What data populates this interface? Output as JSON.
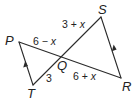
{
  "diagram": {
    "vertices": {
      "P": {
        "label": "P",
        "x": 19,
        "y": 42
      },
      "S": {
        "label": "S",
        "x": 101,
        "y": 17
      },
      "R": {
        "label": "R",
        "x": 121,
        "y": 78
      },
      "T": {
        "label": "T",
        "x": 33,
        "y": 85
      },
      "Q": {
        "label": "Q",
        "x": 61,
        "y": 55
      }
    },
    "segments": [
      {
        "from": "P",
        "to": "R"
      },
      {
        "from": "T",
        "to": "S"
      },
      {
        "from": "P",
        "to": "T"
      },
      {
        "from": "S",
        "to": "R"
      }
    ],
    "segment_labels": {
      "SQ": {
        "prefix": "3 + ",
        "var": "x"
      },
      "PQ": {
        "prefix": "6 − ",
        "var": "x"
      },
      "TQ": {
        "prefix": "3",
        "var": ""
      },
      "QR": {
        "prefix": "6 + ",
        "var": "x"
      }
    },
    "parallel_marks": [
      {
        "segment": "PT",
        "direction": "toward P"
      },
      {
        "segment": "RS",
        "direction": "toward S"
      }
    ],
    "colors": {
      "stroke": "#2a2a2a",
      "text": "#222222",
      "background": "#ffffff"
    }
  }
}
